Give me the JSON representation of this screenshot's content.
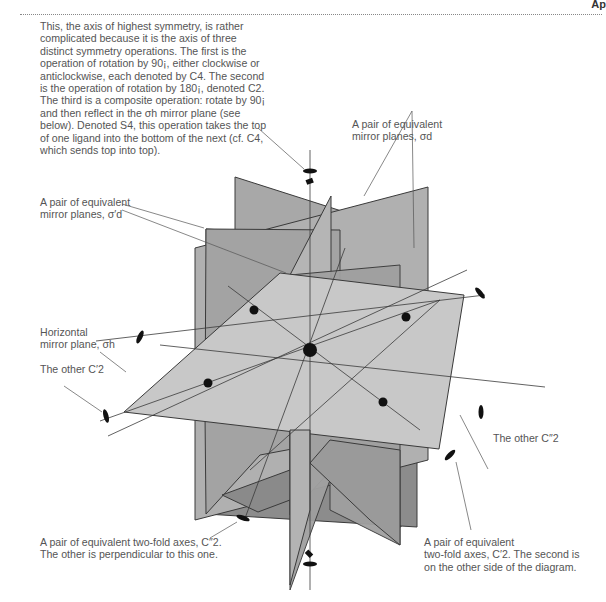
{
  "header": {
    "label": "Ap",
    "rule": "dotted"
  },
  "annotations": {
    "main_axis": "This, the axis of highest symmetry, is rather\ncomplicated because it is the axis of three\ndistinct symmetry operations. The first is the\noperation of rotation by 90¡, either clockwise or\nanticlockwise, each denoted by C4. The second\nis the operation of rotation by 180¡, denoted C2.\nThe third is a composite operation: rotate by 90¡\nand then reflect in the σh mirror plane (see\nbelow). Denoted S4, this operation takes the top\nof one ligand into the bottom of the next (cf. C4,\nwhich sends top into top).",
    "sigma_d": "A pair of equivalent\nmirror planes, σd",
    "sigma_d_prime": "A pair of equivalent\nmirror planes, σ′d",
    "horizontal_mirror": "Horizontal\nmirror plane, σh",
    "other_c2_prime": "The other C′2",
    "other_c2_double_prime": "The other C″2",
    "c2_double_prime_pair": "A pair of equivalent two-fold axes, C″2.\nThe other is perpendicular to this one.",
    "c2_prime_pair": "A pair of equivalent\ntwo-fold axes, C′2. The second is\non the other side of the diagram."
  },
  "colors": {
    "plane_light": "#c9c9c9",
    "plane_mid": "#a9a9a9",
    "plane_dark": "#8a8a8a",
    "edge": "#3a3a3a",
    "atom": "#111111",
    "text": "#555555"
  }
}
